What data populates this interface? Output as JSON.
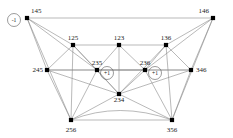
{
  "figure": {
    "type": "graph-diagram",
    "background_color": "#ffffff",
    "edge_color": "#8a8a8a",
    "vertex_color": "#000000",
    "label_color": "#1a1a1a"
  },
  "vertices": [
    {
      "id": "v145",
      "label": "145",
      "x": 27,
      "y": 18,
      "label_x": 31,
      "label_y": 13,
      "anchor": "start"
    },
    {
      "id": "v146",
      "label": "146",
      "x": 213,
      "y": 18,
      "label_x": 209,
      "label_y": 13,
      "anchor": "end"
    },
    {
      "id": "v125",
      "label": "125",
      "x": 73,
      "y": 45,
      "label_x": 73,
      "label_y": 40,
      "anchor": "middle"
    },
    {
      "id": "v123",
      "label": "123",
      "x": 119,
      "y": 45,
      "label_x": 119,
      "label_y": 40,
      "anchor": "middle"
    },
    {
      "id": "v136",
      "label": "136",
      "x": 166,
      "y": 45,
      "label_x": 166,
      "label_y": 40,
      "anchor": "middle"
    },
    {
      "id": "v245",
      "label": "245",
      "x": 47,
      "y": 70,
      "label_x": 43,
      "label_y": 72,
      "anchor": "end"
    },
    {
      "id": "v235",
      "label": "235",
      "x": 97,
      "y": 70,
      "label_x": 97,
      "label_y": 65,
      "anchor": "middle"
    },
    {
      "id": "v236",
      "label": "236",
      "x": 145,
      "y": 70,
      "label_x": 145,
      "label_y": 65,
      "anchor": "middle"
    },
    {
      "id": "v346",
      "label": "346",
      "x": 191,
      "y": 70,
      "label_x": 196,
      "label_y": 72,
      "anchor": "start"
    },
    {
      "id": "v234",
      "label": "234",
      "x": 119,
      "y": 94,
      "label_x": 119,
      "label_y": 102,
      "anchor": "middle"
    },
    {
      "id": "v256",
      "label": "256",
      "x": 71,
      "y": 120,
      "label_x": 71,
      "label_y": 132,
      "anchor": "middle"
    },
    {
      "id": "v356",
      "label": "356",
      "x": 172,
      "y": 120,
      "label_x": 172,
      "label_y": 132,
      "anchor": "middle"
    }
  ],
  "badges": [
    {
      "id": "b145",
      "label": "-1",
      "cx": 14,
      "cy": 20,
      "r": 6.5
    },
    {
      "id": "b235",
      "label": "+1",
      "cx": 107,
      "cy": 73,
      "r": 6.5
    },
    {
      "id": "b236",
      "label": "+1",
      "cx": 155,
      "cy": 73,
      "r": 6.5
    }
  ],
  "edges": [
    {
      "from": "v145",
      "to": "v146"
    },
    {
      "from": "v145",
      "to": "v125"
    },
    {
      "from": "v145",
      "to": "v245"
    },
    {
      "from": "v145",
      "to": "v235"
    },
    {
      "from": "v145",
      "to": "v256"
    },
    {
      "from": "v146",
      "to": "v136"
    },
    {
      "from": "v146",
      "to": "v346"
    },
    {
      "from": "v146",
      "to": "v236"
    },
    {
      "from": "v146",
      "to": "v356"
    },
    {
      "from": "v125",
      "to": "v123"
    },
    {
      "from": "v125",
      "to": "v245"
    },
    {
      "from": "v125",
      "to": "v235"
    },
    {
      "from": "v125",
      "to": "v234"
    },
    {
      "from": "v125",
      "to": "v256"
    },
    {
      "from": "v123",
      "to": "v136"
    },
    {
      "from": "v123",
      "to": "v235"
    },
    {
      "from": "v123",
      "to": "v236"
    },
    {
      "from": "v123",
      "to": "v234"
    },
    {
      "from": "v136",
      "to": "v236"
    },
    {
      "from": "v136",
      "to": "v346"
    },
    {
      "from": "v136",
      "to": "v234"
    },
    {
      "from": "v136",
      "to": "v356"
    },
    {
      "from": "v245",
      "to": "v235"
    },
    {
      "from": "v245",
      "to": "v236"
    },
    {
      "from": "v245",
      "to": "v256"
    },
    {
      "from": "v245",
      "to": "v234"
    },
    {
      "from": "v235",
      "to": "v236"
    },
    {
      "from": "v235",
      "to": "v234"
    },
    {
      "from": "v235",
      "to": "v256"
    },
    {
      "from": "v236",
      "to": "v346"
    },
    {
      "from": "v236",
      "to": "v234"
    },
    {
      "from": "v236",
      "to": "v356"
    },
    {
      "from": "v346",
      "to": "v235"
    },
    {
      "from": "v346",
      "to": "v356"
    },
    {
      "from": "v346",
      "to": "v234"
    },
    {
      "from": "v234",
      "to": "v256"
    },
    {
      "from": "v234",
      "to": "v356"
    },
    {
      "from": "v256",
      "to": "v356"
    }
  ],
  "curved_edges": [
    {
      "from": "v256",
      "to": "v356",
      "cx": 119,
      "cy": 101
    }
  ]
}
